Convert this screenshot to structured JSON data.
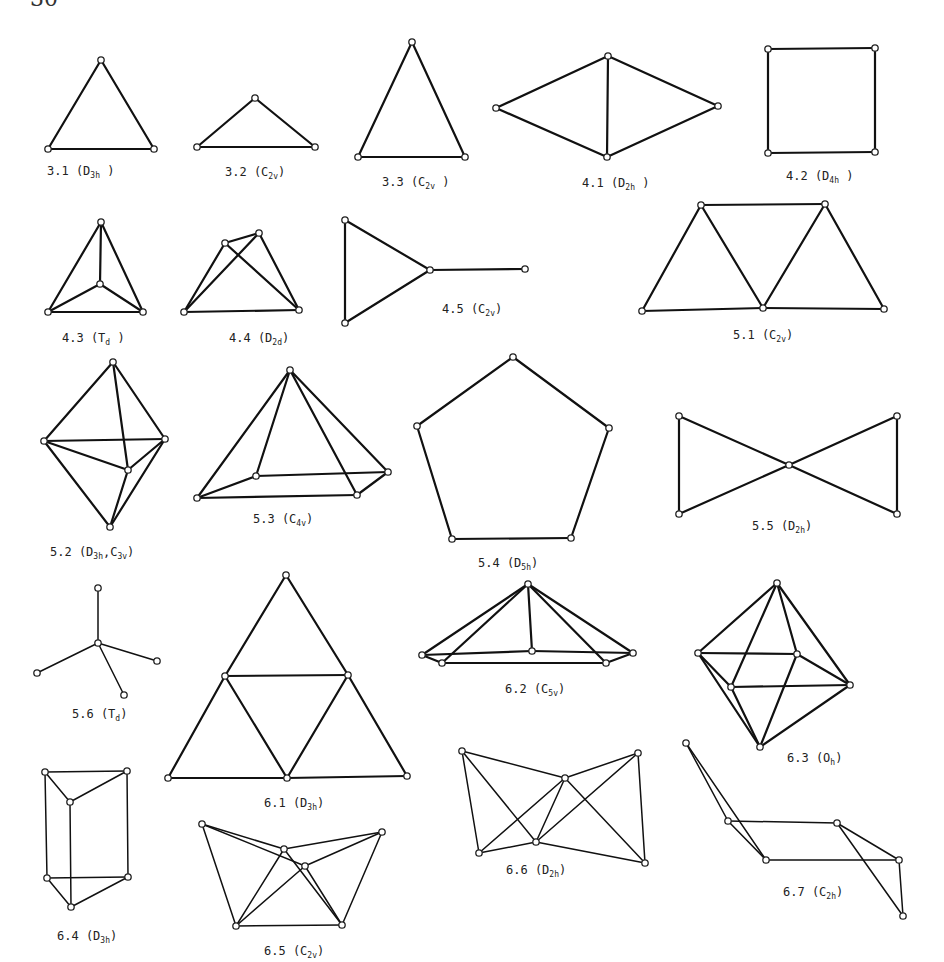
{
  "page": {
    "number": "30"
  },
  "figures": [
    {
      "id": "3.1",
      "label": "3.1 (D",
      "sub": "3h",
      "tail": " )",
      "lx": 47,
      "ly": 175,
      "nodes": [
        [
          101,
          60
        ],
        [
          48,
          149
        ],
        [
          154,
          149
        ]
      ],
      "edges": [
        [
          0,
          1
        ],
        [
          0,
          2
        ],
        [
          1,
          2
        ]
      ]
    },
    {
      "id": "3.2",
      "label": "3.2 (C",
      "sub": "2v",
      "tail": ")",
      "lx": 225,
      "ly": 176,
      "nodes": [
        [
          255,
          98
        ],
        [
          197,
          147
        ],
        [
          315,
          147
        ]
      ],
      "edges": [
        [
          0,
          1
        ],
        [
          0,
          2
        ],
        [
          1,
          2
        ]
      ]
    },
    {
      "id": "3.3",
      "label": "3.3 (C",
      "sub": "2v",
      "tail": " )",
      "lx": 382,
      "ly": 186,
      "nodes": [
        [
          412,
          42
        ],
        [
          358,
          157
        ],
        [
          465,
          157
        ]
      ],
      "edges": [
        [
          0,
          1
        ],
        [
          0,
          2
        ],
        [
          1,
          2
        ]
      ]
    },
    {
      "id": "4.1",
      "label": "4.1 (D",
      "sub": "2h",
      "tail": " )",
      "lx": 582,
      "ly": 187,
      "nodes": [
        [
          608,
          56
        ],
        [
          496,
          108
        ],
        [
          718,
          106
        ],
        [
          607,
          157
        ]
      ],
      "edges": [
        [
          0,
          1
        ],
        [
          0,
          2
        ],
        [
          1,
          3
        ],
        [
          2,
          3
        ],
        [
          0,
          3
        ]
      ]
    },
    {
      "id": "4.2",
      "label": "4.2 (D",
      "sub": "4h",
      "tail": " )",
      "lx": 786,
      "ly": 180,
      "nodes": [
        [
          768,
          49
        ],
        [
          875,
          48
        ],
        [
          768,
          153
        ],
        [
          875,
          152
        ]
      ],
      "edges": [
        [
          0,
          1
        ],
        [
          1,
          3
        ],
        [
          3,
          2
        ],
        [
          2,
          0
        ]
      ]
    },
    {
      "id": "4.3",
      "label": "4.3 (T",
      "sub": "d",
      "tail": " )",
      "lx": 62,
      "ly": 342,
      "nodes": [
        [
          101,
          222
        ],
        [
          48,
          312
        ],
        [
          143,
          312
        ],
        [
          100,
          284
        ]
      ],
      "edges": [
        [
          0,
          1
        ],
        [
          0,
          2
        ],
        [
          1,
          2
        ],
        [
          0,
          3
        ],
        [
          1,
          3
        ],
        [
          2,
          3
        ]
      ]
    },
    {
      "id": "4.4",
      "label": "4.4 (D",
      "sub": "2d",
      "tail": ")",
      "lx": 229,
      "ly": 342,
      "nodes": [
        [
          225,
          243
        ],
        [
          259,
          233
        ],
        [
          184,
          312
        ],
        [
          299,
          310
        ]
      ],
      "edges": [
        [
          0,
          1
        ],
        [
          0,
          2
        ],
        [
          0,
          3
        ],
        [
          1,
          2
        ],
        [
          1,
          3
        ],
        [
          2,
          3
        ]
      ]
    },
    {
      "id": "4.5",
      "label": "4.5 (C",
      "sub": "2v",
      "tail": ")",
      "lx": 442,
      "ly": 313,
      "nodes": [
        [
          345,
          220
        ],
        [
          345,
          323
        ],
        [
          430,
          270
        ],
        [
          525,
          269
        ]
      ],
      "edges": [
        [
          0,
          1
        ],
        [
          0,
          2
        ],
        [
          1,
          2
        ],
        [
          2,
          3
        ]
      ]
    },
    {
      "id": "5.1",
      "label": "5.1 (C",
      "sub": "2v",
      "tail": ")",
      "lx": 733,
      "ly": 339,
      "nodes": [
        [
          701,
          205
        ],
        [
          825,
          204
        ],
        [
          642,
          311
        ],
        [
          763,
          308
        ],
        [
          884,
          309
        ]
      ],
      "edges": [
        [
          0,
          1
        ],
        [
          0,
          2
        ],
        [
          0,
          3
        ],
        [
          1,
          3
        ],
        [
          1,
          4
        ],
        [
          2,
          3
        ],
        [
          3,
          4
        ]
      ]
    },
    {
      "id": "5.2",
      "label": "5.2 (D",
      "sub": "3h",
      "tail": ",C",
      "sub2": "3v",
      "tail2": ")",
      "lx": 50,
      "ly": 556,
      "nodes": [
        [
          113,
          362
        ],
        [
          44,
          441
        ],
        [
          165,
          439
        ],
        [
          128,
          470
        ],
        [
          110,
          527
        ]
      ],
      "edges": [
        [
          0,
          1
        ],
        [
          0,
          2
        ],
        [
          0,
          3
        ],
        [
          1,
          2
        ],
        [
          1,
          3
        ],
        [
          2,
          3
        ],
        [
          1,
          4
        ],
        [
          2,
          4
        ],
        [
          3,
          4
        ]
      ]
    },
    {
      "id": "5.3",
      "label": "5.3 (C",
      "sub": "4v",
      "tail": ")",
      "lx": 253,
      "ly": 523,
      "nodes": [
        [
          290,
          370
        ],
        [
          197,
          498
        ],
        [
          256,
          476
        ],
        [
          388,
          472
        ],
        [
          357,
          495
        ]
      ],
      "edges": [
        [
          0,
          1
        ],
        [
          0,
          2
        ],
        [
          0,
          3
        ],
        [
          0,
          4
        ],
        [
          1,
          2
        ],
        [
          2,
          3
        ],
        [
          3,
          4
        ],
        [
          4,
          1
        ]
      ]
    },
    {
      "id": "5.4",
      "label": "5.4 (D",
      "sub": "5h",
      "tail": ")",
      "lx": 478,
      "ly": 567,
      "nodes": [
        [
          513,
          357
        ],
        [
          417,
          426
        ],
        [
          609,
          428
        ],
        [
          452,
          539
        ],
        [
          571,
          538
        ]
      ],
      "edges": [
        [
          0,
          1
        ],
        [
          0,
          2
        ],
        [
          1,
          3
        ],
        [
          2,
          4
        ],
        [
          3,
          4
        ]
      ]
    },
    {
      "id": "5.5",
      "label": "5.5 (D",
      "sub": "2h",
      "tail": ")",
      "lx": 752,
      "ly": 530,
      "nodes": [
        [
          679,
          416
        ],
        [
          679,
          514
        ],
        [
          789,
          465
        ],
        [
          897,
          416
        ],
        [
          897,
          514
        ]
      ],
      "edges": [
        [
          0,
          1
        ],
        [
          0,
          2
        ],
        [
          1,
          2
        ],
        [
          2,
          3
        ],
        [
          2,
          4
        ],
        [
          3,
          4
        ]
      ]
    },
    {
      "id": "5.6",
      "label": "5.6 (T",
      "sub": "d",
      "tail": ")",
      "lx": 72,
      "ly": 718,
      "nodes": [
        [
          98,
          588
        ],
        [
          98,
          643
        ],
        [
          37,
          673
        ],
        [
          157,
          661
        ],
        [
          124,
          695
        ]
      ],
      "edges": [
        [
          0,
          1
        ],
        [
          1,
          2
        ],
        [
          1,
          3
        ],
        [
          1,
          4
        ]
      ],
      "thin": true
    },
    {
      "id": "6.1",
      "label": "6.1 (D",
      "sub": "3h",
      "tail": ")",
      "lx": 264,
      "ly": 807,
      "nodes": [
        [
          286,
          575
        ],
        [
          225,
          676
        ],
        [
          348,
          675
        ],
        [
          168,
          778
        ],
        [
          287,
          778
        ],
        [
          407,
          776
        ]
      ],
      "edges": [
        [
          0,
          1
        ],
        [
          0,
          2
        ],
        [
          1,
          2
        ],
        [
          1,
          3
        ],
        [
          1,
          4
        ],
        [
          2,
          4
        ],
        [
          2,
          5
        ],
        [
          3,
          4
        ],
        [
          4,
          5
        ]
      ]
    },
    {
      "id": "6.2",
      "label": "6.2 (C",
      "sub": "5v",
      "tail": ")",
      "lx": 505,
      "ly": 693,
      "nodes": [
        [
          528,
          584
        ],
        [
          422,
          655
        ],
        [
          442,
          663
        ],
        [
          633,
          653
        ],
        [
          606,
          663
        ],
        [
          532,
          651
        ]
      ],
      "edges": [
        [
          0,
          1
        ],
        [
          0,
          2
        ],
        [
          0,
          3
        ],
        [
          0,
          4
        ],
        [
          0,
          5
        ],
        [
          1,
          2
        ],
        [
          2,
          4
        ],
        [
          4,
          3
        ],
        [
          1,
          5
        ],
        [
          5,
          3
        ]
      ]
    },
    {
      "id": "6.3",
      "label": "6.3 (O",
      "sub": "h",
      "tail": ")",
      "lx": 787,
      "ly": 762,
      "nodes": [
        [
          777,
          583
        ],
        [
          698,
          653
        ],
        [
          797,
          654
        ],
        [
          850,
          685
        ],
        [
          731,
          687
        ],
        [
          760,
          747
        ]
      ],
      "edges": [
        [
          0,
          1
        ],
        [
          0,
          2
        ],
        [
          0,
          3
        ],
        [
          0,
          4
        ],
        [
          1,
          2
        ],
        [
          2,
          3
        ],
        [
          3,
          4
        ],
        [
          4,
          1
        ],
        [
          1,
          5
        ],
        [
          2,
          5
        ],
        [
          3,
          5
        ],
        [
          4,
          5
        ]
      ]
    },
    {
      "id": "6.4",
      "label": "6.4 (D",
      "sub": "3h",
      "tail": ")",
      "lx": 57,
      "ly": 940,
      "nodes": [
        [
          45,
          772
        ],
        [
          127,
          771
        ],
        [
          70,
          802
        ],
        [
          47,
          878
        ],
        [
          128,
          877
        ],
        [
          71,
          907
        ]
      ],
      "edges": [
        [
          0,
          1
        ],
        [
          0,
          2
        ],
        [
          1,
          2
        ],
        [
          0,
          3
        ],
        [
          1,
          4
        ],
        [
          2,
          5
        ],
        [
          3,
          4
        ],
        [
          3,
          5
        ],
        [
          4,
          5
        ]
      ],
      "thin": true
    },
    {
      "id": "6.5",
      "label": "6.5 (C",
      "sub": "2v",
      "tail": ")",
      "lx": 264,
      "ly": 955,
      "nodes": [
        [
          202,
          824
        ],
        [
          382,
          832
        ],
        [
          284,
          849
        ],
        [
          305,
          866
        ],
        [
          236,
          926
        ],
        [
          342,
          925
        ]
      ],
      "edges": [
        [
          0,
          2
        ],
        [
          0,
          3
        ],
        [
          0,
          4
        ],
        [
          1,
          2
        ],
        [
          1,
          3
        ],
        [
          1,
          5
        ],
        [
          2,
          4
        ],
        [
          3,
          4
        ],
        [
          2,
          5
        ],
        [
          3,
          5
        ],
        [
          4,
          5
        ]
      ],
      "thin": true
    },
    {
      "id": "6.6",
      "label": "6.6 (D",
      "sub": "2h",
      "tail": ")",
      "lx": 506,
      "ly": 874,
      "nodes": [
        [
          462,
          751
        ],
        [
          638,
          753
        ],
        [
          565,
          778
        ],
        [
          536,
          842
        ],
        [
          479,
          853
        ],
        [
          645,
          863
        ]
      ],
      "edges": [
        [
          0,
          2
        ],
        [
          0,
          3
        ],
        [
          0,
          4
        ],
        [
          1,
          2
        ],
        [
          1,
          3
        ],
        [
          1,
          5
        ],
        [
          2,
          3
        ],
        [
          2,
          4
        ],
        [
          2,
          5
        ],
        [
          3,
          4
        ],
        [
          3,
          5
        ]
      ],
      "thin": true
    },
    {
      "id": "6.7",
      "label": "6.7 (C",
      "sub": "2h",
      "tail": ")",
      "lx": 783,
      "ly": 896,
      "nodes": [
        [
          686,
          743
        ],
        [
          728,
          821
        ],
        [
          766,
          860
        ],
        [
          837,
          823
        ],
        [
          899,
          860
        ],
        [
          903,
          916
        ]
      ],
      "edges": [
        [
          0,
          1
        ],
        [
          0,
          2
        ],
        [
          1,
          2
        ],
        [
          1,
          3
        ],
        [
          2,
          4
        ],
        [
          3,
          4
        ],
        [
          3,
          5
        ],
        [
          4,
          5
        ]
      ],
      "thin": true
    }
  ]
}
